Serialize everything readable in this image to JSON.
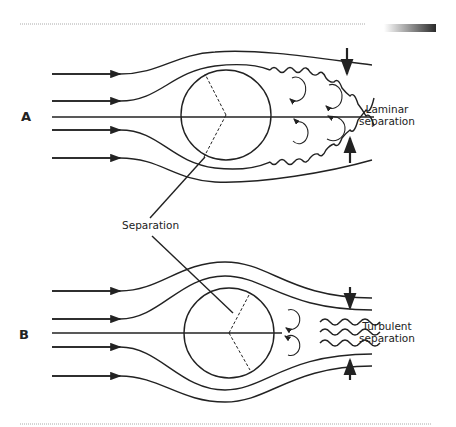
{
  "diagram": {
    "panel_a": {
      "label": "A",
      "annotation_line1": "Laminar",
      "annotation_line2": "separation"
    },
    "panel_b": {
      "label": "B",
      "annotation_line1": "Turbulent",
      "annotation_line2": "separation"
    },
    "shared_label": "Separation",
    "colors": {
      "stroke": "#222222",
      "background": "#ffffff",
      "rule": "#aaaaaa"
    }
  }
}
